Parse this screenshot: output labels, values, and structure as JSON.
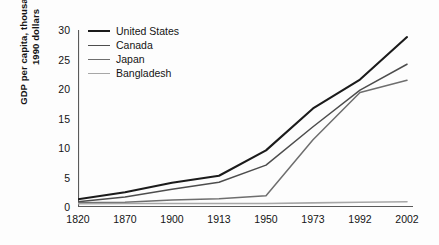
{
  "chart_data": {
    "type": "line",
    "title": "",
    "xlabel": "",
    "ylabel": "GDP per capita, thousands of\n1990 dollars",
    "categories": [
      "1820",
      "1870",
      "1900",
      "1913",
      "1950",
      "1973",
      "1992",
      "2002"
    ],
    "ylim": [
      0,
      30
    ],
    "yticks": [
      "0",
      "5",
      "10",
      "15",
      "20",
      "25",
      "30"
    ],
    "grid": false,
    "legend_position": "top-left",
    "series": [
      {
        "name": "United States",
        "color": "#1b1b1b",
        "width": 2.1,
        "values": [
          1.3,
          2.5,
          4.1,
          5.3,
          9.6,
          16.7,
          21.6,
          28.8
        ]
      },
      {
        "name": "Canada",
        "color": "#4d4d4d",
        "width": 1.5,
        "values": [
          0.9,
          1.7,
          3.0,
          4.2,
          7.1,
          13.6,
          19.8,
          24.2
        ]
      },
      {
        "name": "Japan",
        "color": "#6e6e6e",
        "width": 1.5,
        "values": [
          0.7,
          0.8,
          1.2,
          1.4,
          1.9,
          11.4,
          19.4,
          21.5
        ]
      },
      {
        "name": "Bangladesh",
        "color": "#a7a7a7",
        "width": 1.6,
        "values": [
          0.55,
          0.6,
          0.6,
          0.6,
          0.6,
          0.7,
          0.8,
          0.9
        ]
      }
    ]
  }
}
